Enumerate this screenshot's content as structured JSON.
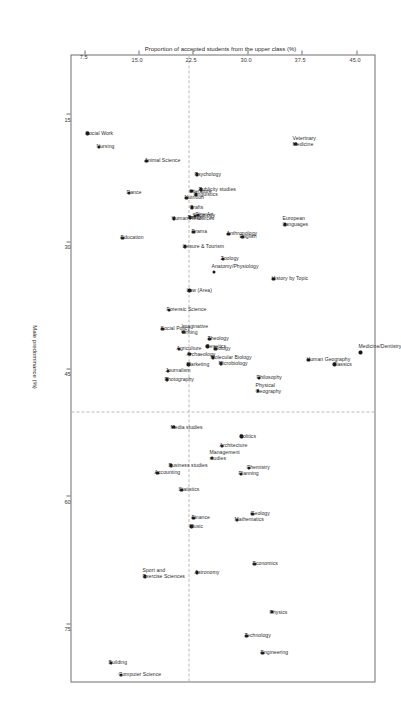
{
  "chart_data": {
    "type": "scatter",
    "title": "",
    "xlabel": "Male predominance (%)",
    "ylabel": "Proportion of accepted students from the upper class (%)",
    "xlim": [
      8,
      82
    ],
    "ylim": [
      5.5,
      47.5
    ],
    "xticks": [
      "15",
      "30",
      "45",
      "60",
      "75"
    ],
    "xtick_values": [
      15,
      30,
      45,
      60,
      75
    ],
    "yticks": [
      "45.0",
      "37.5",
      "30.0",
      "22.5",
      "15.0",
      "7.5"
    ],
    "ytick_values": [
      45.0,
      37.5,
      30.0,
      22.5,
      15.0,
      7.5
    ],
    "grid": false,
    "reference_lines": {
      "vertical_x": 50.0,
      "horizontal_y": 22.0,
      "style": "dashed",
      "color": "#b9b9b9"
    },
    "marker_color": "#151515",
    "legend": "none",
    "points": [
      {
        "label": "Medicine/Dentistry",
        "x": 43.0,
        "y": 45.6
      },
      {
        "label": "Classics",
        "x": 44.4,
        "y": 42.0
      },
      {
        "label": "Human Geography",
        "x": 43.9,
        "y": 38.4
      },
      {
        "label": "Veterinary Medicine",
        "x": 18.4,
        "y": 36.6
      },
      {
        "label": "European Languages",
        "x": 27.9,
        "y": 35.2
      },
      {
        "label": "History by Topic",
        "x": 34.3,
        "y": 33.6
      },
      {
        "label": "Physics",
        "x": 73.6,
        "y": 33.4
      },
      {
        "label": "Engineering",
        "x": 78.4,
        "y": 32.1
      },
      {
        "label": "Philosophy",
        "x": 46.0,
        "y": 31.6
      },
      {
        "label": "Physical Geography",
        "x": 47.5,
        "y": 31.5
      },
      {
        "label": "Economics",
        "x": 67.9,
        "y": 31.0
      },
      {
        "label": "Geology",
        "x": 62.0,
        "y": 30.7
      },
      {
        "label": "Chemistry",
        "x": 56.6,
        "y": 30.2
      },
      {
        "label": "Technology",
        "x": 76.4,
        "y": 29.9
      },
      {
        "label": "English",
        "x": 29.4,
        "y": 29.3
      },
      {
        "label": "Politics",
        "x": 52.9,
        "y": 29.2
      },
      {
        "label": "Planning",
        "x": 57.3,
        "y": 29.1
      },
      {
        "label": "Mathematics",
        "x": 62.7,
        "y": 28.6
      },
      {
        "label": "Anthropology",
        "x": 29.0,
        "y": 27.4
      },
      {
        "label": "Zoology",
        "x": 32.0,
        "y": 26.6
      },
      {
        "label": "Architecture",
        "x": 54.0,
        "y": 26.5
      },
      {
        "label": "Microbiology",
        "x": 44.3,
        "y": 26.4
      },
      {
        "label": "Biology",
        "x": 42.6,
        "y": 25.6
      },
      {
        "label": "Anatomy/Physiology",
        "x": 33.5,
        "y": 25.4
      },
      {
        "label": "Molecular Biology",
        "x": 43.6,
        "y": 25.3
      },
      {
        "label": "Management studies",
        "x": 55.4,
        "y": 25.1
      },
      {
        "label": "Theology",
        "x": 41.4,
        "y": 24.8
      },
      {
        "label": "Genetics",
        "x": 42.3,
        "y": 24.5
      },
      {
        "label": "Publicity studies",
        "x": 23.8,
        "y": 23.6
      },
      {
        "label": "Fine Art",
        "x": 26.8,
        "y": 23.2
      },
      {
        "label": "Psychology",
        "x": 22.0,
        "y": 23.1
      },
      {
        "label": "Astronomy",
        "x": 68.9,
        "y": 23.1
      },
      {
        "label": "Linguistics",
        "x": 24.4,
        "y": 22.9
      },
      {
        "label": "Sociology",
        "x": 26.9,
        "y": 22.8
      },
      {
        "label": "Drama",
        "x": 28.8,
        "y": 22.6
      },
      {
        "label": "Finance",
        "x": 62.5,
        "y": 22.6
      },
      {
        "label": "Crafts",
        "x": 25.9,
        "y": 22.4
      },
      {
        "label": "Literature",
        "x": 24.0,
        "y": 22.3
      },
      {
        "label": "Music",
        "x": 63.5,
        "y": 22.3
      },
      {
        "label": "Design",
        "x": 27.1,
        "y": 22.1
      },
      {
        "label": "Law (Area)",
        "x": 35.7,
        "y": 22.0
      },
      {
        "label": "Archaeology",
        "x": 43.2,
        "y": 22.0
      },
      {
        "label": "Marketing",
        "x": 44.4,
        "y": 21.9
      },
      {
        "label": "Nutrition",
        "x": 24.8,
        "y": 21.6
      },
      {
        "label": "Leisure & Tourism",
        "x": 30.5,
        "y": 21.4
      },
      {
        "label": "Imaginative Writing",
        "x": 40.6,
        "y": 21.2
      },
      {
        "label": "Statistics",
        "x": 59.2,
        "y": 20.9
      },
      {
        "label": "Agriculture",
        "x": 42.6,
        "y": 20.6
      },
      {
        "label": "Human Resources",
        "x": 27.2,
        "y": 19.9
      },
      {
        "label": "Media studies",
        "x": 51.8,
        "y": 19.8
      },
      {
        "label": "Business studies",
        "x": 56.3,
        "y": 19.5
      },
      {
        "label": "Forensic Science",
        "x": 38.0,
        "y": 19.2
      },
      {
        "label": "Journalism",
        "x": 45.2,
        "y": 19.1
      },
      {
        "label": "Photography",
        "x": 46.2,
        "y": 18.9
      },
      {
        "label": "Social Policy",
        "x": 40.2,
        "y": 18.3
      },
      {
        "label": "Accounting",
        "x": 57.2,
        "y": 17.6
      },
      {
        "label": "Animal Science",
        "x": 20.4,
        "y": 16.1
      },
      {
        "label": "Sport and Exercise Sciences",
        "x": 69.4,
        "y": 15.9
      },
      {
        "label": "Dance",
        "x": 24.2,
        "y": 13.7
      },
      {
        "label": "Education",
        "x": 29.5,
        "y": 12.8
      },
      {
        "label": "Computer Science",
        "x": 81.0,
        "y": 12.6
      },
      {
        "label": "Building",
        "x": 79.6,
        "y": 11.2
      },
      {
        "label": "Nursing",
        "x": 18.8,
        "y": 9.6
      },
      {
        "label": "Social Work",
        "x": 17.2,
        "y": 8.0
      }
    ]
  }
}
